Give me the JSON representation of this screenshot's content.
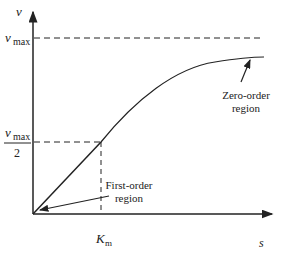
{
  "diagram": {
    "type": "Michaelis-Menten saturation curve",
    "axes": {
      "y_label": "v",
      "x_label": "s"
    },
    "markers": {
      "vmax_label_main": "v",
      "vmax_label_sub": "max",
      "half_vmax_numer_main": "v",
      "half_vmax_numer_sub": "max",
      "half_vmax_denom": "2",
      "km_label_main": "K",
      "km_label_sub": "m"
    },
    "annotations": {
      "zero_order_line1": "Zero-order",
      "zero_order_line2": "region",
      "first_order_line1": "First-order",
      "first_order_line2": "region"
    },
    "colors": {
      "line": "#222222",
      "background": "#ffffff"
    }
  }
}
